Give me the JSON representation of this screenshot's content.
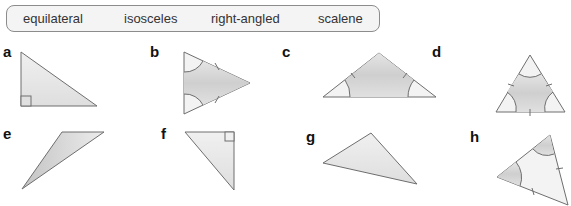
{
  "word_bank": [
    "equilateral",
    "isosceles",
    "right-angled",
    "scalene"
  ],
  "shapes": [
    {
      "label": "a",
      "description": "right-angled triangle with right-angle mark"
    },
    {
      "label": "b",
      "description": "isosceles triangle with two equal sides and two equal angles marked"
    },
    {
      "label": "c",
      "description": "isosceles triangle with two equal sides and two equal base angles marked"
    },
    {
      "label": "d",
      "description": "equilateral triangle with three equal sides and three equal angles marked"
    },
    {
      "label": "e",
      "description": "scalene triangle"
    },
    {
      "label": "f",
      "description": "right-angled triangle with right-angle mark"
    },
    {
      "label": "g",
      "description": "scalene triangle"
    },
    {
      "label": "h",
      "description": "isosceles triangle with two equal sides and two equal angles marked"
    }
  ],
  "colors": {
    "fill_light": "#e6e6e6",
    "fill_dark": "#c8c8c8",
    "stroke": "#6e6e6e"
  }
}
